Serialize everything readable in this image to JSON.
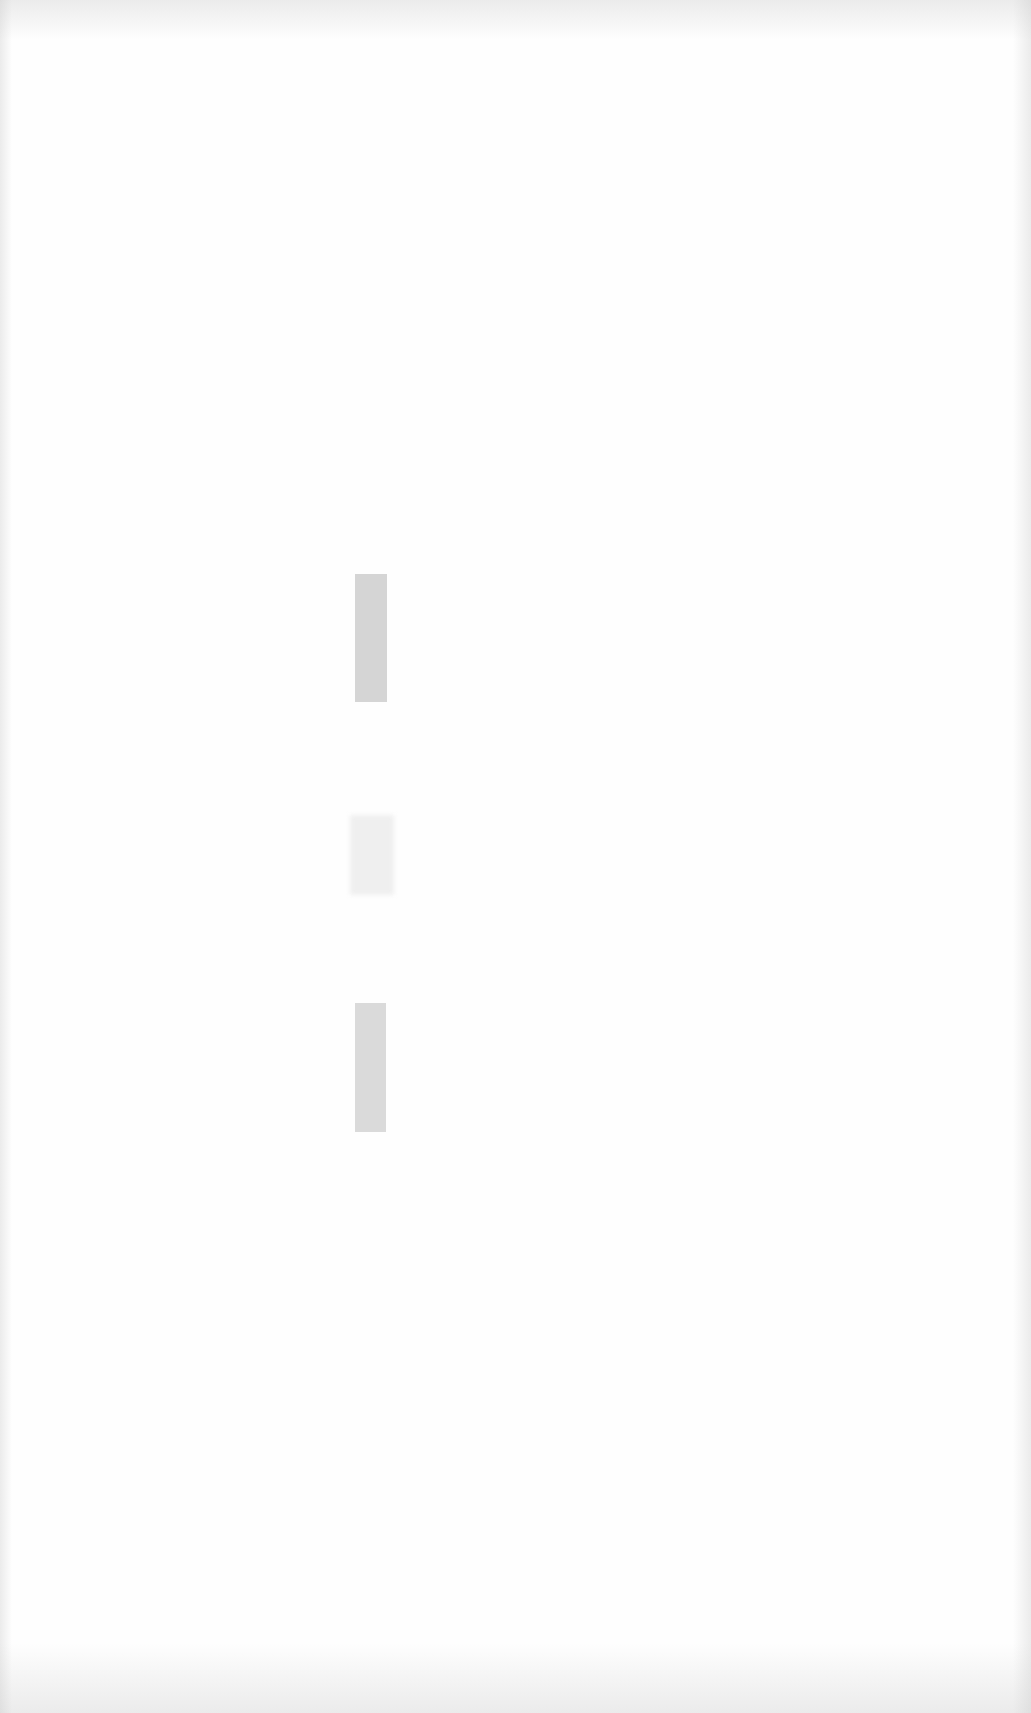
{
  "document": {
    "type": "scanned blank page",
    "text": "",
    "marks": [
      {
        "name": "scan-mark-1",
        "x": 355,
        "y": 574,
        "width": 32,
        "height": 128,
        "color": "#cfcfcf",
        "style": "solid"
      },
      {
        "name": "scan-mark-2",
        "x": 350,
        "y": 815,
        "width": 44,
        "height": 80,
        "color": "#ececec",
        "style": "faint"
      },
      {
        "name": "scan-mark-3",
        "x": 355,
        "y": 1003,
        "width": 31,
        "height": 129,
        "color": "#d4d4d4",
        "style": "solid"
      }
    ]
  }
}
